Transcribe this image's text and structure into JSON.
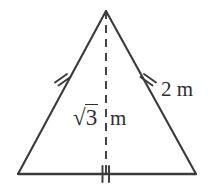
{
  "figure": {
    "background_color": "#ffffff",
    "stroke_color": "#3a3a3a",
    "text_color": "#2e2e2e",
    "labels": {
      "side_length": "2 m",
      "altitude_radical_symbol": "√",
      "altitude_radicand": "3",
      "altitude_unit": "m"
    },
    "geometry": {
      "apex": {
        "x": 106,
        "y": 11
      },
      "bottom_left": {
        "x": 18,
        "y": 174
      },
      "bottom_right": {
        "x": 196,
        "y": 174
      },
      "altitude_foot": {
        "x": 106,
        "y": 174
      }
    },
    "tick_marks": {
      "left_side": {
        "count": 2,
        "x": 62,
        "y": 79
      },
      "right_side": {
        "count": 2,
        "x": 147,
        "y": 79
      },
      "base": {
        "count": 2,
        "x": 106,
        "y": 174
      }
    },
    "altitude_line_style": "dashed"
  }
}
